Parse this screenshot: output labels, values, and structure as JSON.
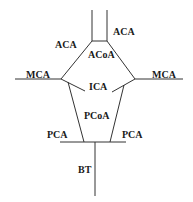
{
  "diagram": {
    "labels": {
      "aca_left": "ACA",
      "aca_right": "ACA",
      "acoa": "ACoA",
      "mca_left": "MCA",
      "mca_right": "MCA",
      "ica": "ICA",
      "pcoa": "PCoA",
      "pca_left": "PCA",
      "pca_right": "PCA",
      "bt": "BT"
    },
    "colors": {
      "line": "#333333",
      "text": "#1a1a1a",
      "background": "#ffffff"
    }
  }
}
